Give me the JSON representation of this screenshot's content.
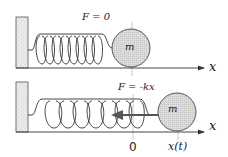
{
  "diagram": {
    "top_panel": {
      "force_label": "F = 0",
      "mass_label": "m",
      "axis_label": "x"
    },
    "bottom_panel": {
      "force_label": "F = -kx",
      "mass_label": "m",
      "axis_label": "x",
      "origin_label": "0",
      "position_label": "x(t)"
    },
    "colors": {
      "ink": "#333333",
      "mass_fill": "#d9d9d9",
      "wall_fill": "#e6e6e6",
      "guide": "#bbbbbb",
      "arrow": "#555555"
    }
  }
}
